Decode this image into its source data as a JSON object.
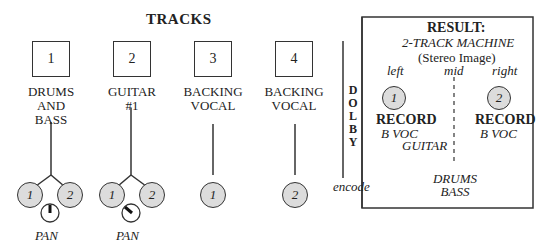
{
  "title": "TRACKS",
  "tracks": [
    {
      "number": "1",
      "label_lines": [
        "DRUMS",
        "AND",
        "BASS"
      ],
      "outputs": [
        "1",
        "2"
      ],
      "pan": "center"
    },
    {
      "number": "2",
      "label_lines": [
        "GUITAR",
        "#1"
      ],
      "outputs": [
        "1",
        "2"
      ],
      "pan": "left"
    },
    {
      "number": "3",
      "label_lines": [
        "BACKING",
        "VOCAL"
      ],
      "outputs": [
        "1"
      ]
    },
    {
      "number": "4",
      "label_lines": [
        "BACKING",
        "VOCAL"
      ],
      "outputs": [
        "2"
      ]
    }
  ],
  "pan_label": "PAN",
  "dolby": {
    "letters": [
      "D",
      "O",
      "L",
      "B",
      "Y"
    ],
    "encode_label": "encode"
  },
  "result": {
    "heading": "RESULT:",
    "machine": "2-TRACK MACHINE",
    "subtitle": "(Stereo Image)",
    "positions": {
      "left": "left",
      "mid": "mid",
      "right": "right"
    },
    "left_channel": {
      "number": "1",
      "label": "RECORD",
      "contents": [
        "B VOC",
        "GUITAR"
      ]
    },
    "right_channel": {
      "number": "2",
      "label": "RECORD",
      "contents": [
        "B VOC"
      ]
    },
    "center_contents": [
      "DRUMS",
      "BASS"
    ]
  }
}
